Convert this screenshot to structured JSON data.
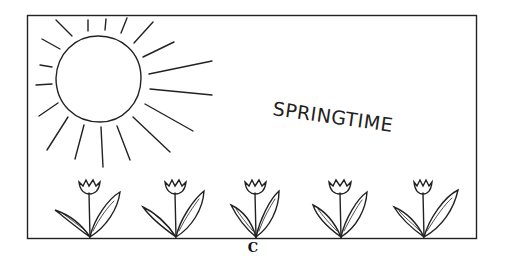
{
  "illustration": {
    "title_text": "SPRINGTIME",
    "caption_label": "C",
    "elements": {
      "sun": "sun-with-rays",
      "flowers": [
        "tulip",
        "tulip",
        "tulip",
        "tulip",
        "tulip"
      ]
    },
    "colors": {
      "ink": "#222222",
      "background": "#ffffff"
    }
  }
}
